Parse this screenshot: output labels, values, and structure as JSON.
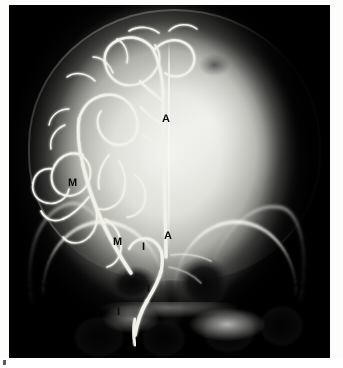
{
  "figure": {
    "type": "radiograph",
    "modality": "cerebral-angiogram",
    "view": "anteroposterior-skull",
    "background_color": "#ffffff",
    "plate_color": "#050505"
  },
  "annotations": [
    {
      "id": "a-upper",
      "label": "A",
      "name": "annotation-a-anterior-cerebral-upper",
      "x": 162,
      "y": 114
    },
    {
      "id": "a-lower",
      "label": "A",
      "name": "annotation-a-anterior-cerebral-lower",
      "x": 164,
      "y": 231
    },
    {
      "id": "m-upper",
      "label": "M",
      "name": "annotation-m-middle-cerebral-upper",
      "x": 68,
      "y": 178
    },
    {
      "id": "m-lower",
      "label": "M",
      "name": "annotation-m-middle-cerebral-lower",
      "x": 113,
      "y": 237
    },
    {
      "id": "i-first",
      "label": "I",
      "name": "annotation-i-internal-carotid-1",
      "x": 142,
      "y": 242
    },
    {
      "id": "i-second",
      "label": "I",
      "name": "annotation-i-internal-carotid-2",
      "x": 147,
      "y": 284
    },
    {
      "id": "i-third",
      "label": "I",
      "name": "annotation-i-internal-carotid-3",
      "x": 117,
      "y": 307
    },
    {
      "id": "i-fourth",
      "label": "I",
      "name": "annotation-i-internal-carotid-4",
      "x": 119,
      "y": 337
    }
  ],
  "vessels": {
    "stroke_color": "#f2f2ea",
    "description": "opacified anterior and middle cerebral artery branches over the left hemisphere"
  }
}
